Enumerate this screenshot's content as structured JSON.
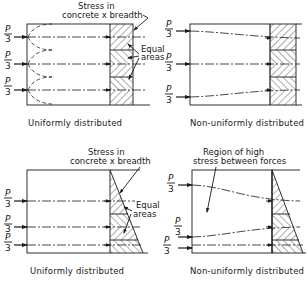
{
  "figure": {
    "panels": [
      {
        "id": "top-left",
        "caption": "Uniformly distributed",
        "annotation_stress": [
          "Stress in",
          "concrete x breadth"
        ],
        "annotation_areas": [
          "Equal",
          "areas"
        ],
        "load_label": {
          "numerator": "P",
          "denominator": "3"
        },
        "stress_shape": "rectangular"
      },
      {
        "id": "top-right",
        "caption": "Non-uniformly distributed",
        "load_label": {
          "numerator": "P",
          "denominator": "3"
        },
        "stress_shape": "rectangular"
      },
      {
        "id": "bottom-left",
        "caption": "Uniformly distributed",
        "annotation_stress": [
          "Stress in",
          "concrete x breadth"
        ],
        "annotation_areas": [
          "Equal",
          "areas"
        ],
        "load_label": {
          "numerator": "P",
          "denominator": "3"
        },
        "stress_shape": "triangular"
      },
      {
        "id": "bottom-right",
        "caption": "Non-uniformly distributed",
        "annotation_region": [
          "Region of high",
          "stress between forces"
        ],
        "load_label": {
          "numerator": "P",
          "denominator": "3"
        },
        "stress_shape": "triangular"
      }
    ]
  },
  "colors": {
    "ink": "#1a1a1a",
    "background": "#ffffff"
  }
}
